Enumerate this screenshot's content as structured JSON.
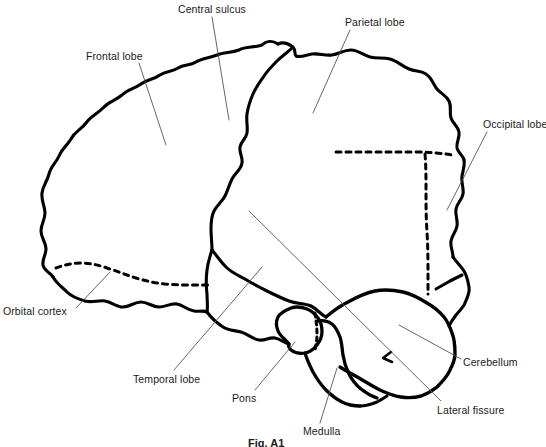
{
  "figure": {
    "caption": "Fig. A1",
    "width": 546,
    "height": 447,
    "background_color": "#ffffff",
    "outline_color": "#000000",
    "leader_line_color": "#555555",
    "text_color": "#1a1a1a"
  },
  "labels": [
    {
      "id": "central-sulcus",
      "text": "Central sulcus",
      "x": 178,
      "y": 3,
      "leader": {
        "x1": 212,
        "y1": 17,
        "x2": 229,
        "y2": 120
      }
    },
    {
      "id": "parietal-lobe",
      "text": "Parietal lobe",
      "x": 345,
      "y": 16,
      "leader": {
        "x1": 350,
        "y1": 30,
        "x2": 313,
        "y2": 113
      }
    },
    {
      "id": "frontal-lobe",
      "text": "Frontal lobe",
      "x": 86,
      "y": 50,
      "leader": {
        "x1": 139,
        "y1": 63,
        "x2": 166,
        "y2": 145
      }
    },
    {
      "id": "occipital-lobe",
      "text": "Occipital lobe",
      "x": 483,
      "y": 118,
      "leader": {
        "x1": 487,
        "y1": 132,
        "x2": 447,
        "y2": 210
      }
    },
    {
      "id": "orbital-cortex",
      "text": "Orbital cortex",
      "x": 3,
      "y": 305,
      "leader": {
        "x1": 76,
        "y1": 308,
        "x2": 110,
        "y2": 272
      }
    },
    {
      "id": "temporal-lobe",
      "text": "Temporal lobe",
      "x": 133,
      "y": 373,
      "leader": {
        "x1": 174,
        "y1": 370,
        "x2": 262,
        "y2": 267
      }
    },
    {
      "id": "pons",
      "text": "Pons",
      "x": 232,
      "y": 392,
      "leader": {
        "x1": 255,
        "y1": 390,
        "x2": 295,
        "y2": 342
      }
    },
    {
      "id": "medulla",
      "text": "Medulla",
      "x": 303,
      "y": 425,
      "leader": {
        "x1": 320,
        "y1": 423,
        "x2": 337,
        "y2": 368
      }
    },
    {
      "id": "cerebellum",
      "text": "Cerebellum",
      "x": 463,
      "y": 356,
      "leader": {
        "x1": 461,
        "y1": 359,
        "x2": 399,
        "y2": 325
      }
    },
    {
      "id": "lateral-fissure",
      "text": "Lateral fissure",
      "x": 437,
      "y": 404,
      "leader": {
        "x1": 441,
        "y1": 401,
        "x2": 249,
        "y2": 211
      }
    }
  ],
  "anatomy_parts": [
    {
      "id": "cerebral-cortex",
      "name": "Cerebral cortex outline",
      "style": "solid"
    },
    {
      "id": "central-sulcus-line",
      "name": "Central sulcus",
      "style": "solid"
    },
    {
      "id": "parieto-occipital-dashed",
      "name": "Parieto-occipital boundary",
      "style": "dashed"
    },
    {
      "id": "orbital-dashed",
      "name": "Orbital cortex boundary",
      "style": "dashed"
    },
    {
      "id": "pons-medulla-dashed",
      "name": "Pons-medulla boundary",
      "style": "dashed"
    },
    {
      "id": "cerebellum-shape",
      "name": "Cerebellum",
      "style": "solid"
    },
    {
      "id": "pons-shape",
      "name": "Pons",
      "style": "solid"
    },
    {
      "id": "medulla-shape",
      "name": "Medulla",
      "style": "solid"
    }
  ]
}
